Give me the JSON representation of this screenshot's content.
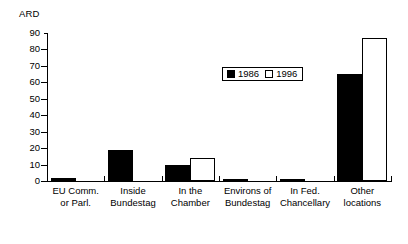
{
  "chart_data": {
    "type": "bar",
    "title": "",
    "xlabel": "",
    "ylabel": "ARD",
    "ylim": [
      0,
      90
    ],
    "ytick_step": 10,
    "yticks": [
      "0",
      "10",
      "20",
      "30",
      "40",
      "50",
      "60",
      "70",
      "80",
      "90"
    ],
    "grid": false,
    "legend_position": "inside-top-right",
    "categories": [
      "EU Comm. or Parl.",
      "Inside Bundestag",
      "In the Chamber",
      "Environs of Bundestag",
      "In Fed. Chancellary",
      "Other locations"
    ],
    "category_lines": [
      [
        "EU Comm.",
        "or Parl."
      ],
      [
        "Inside",
        "Bundestag"
      ],
      [
        "In the",
        "Chamber"
      ],
      [
        "Environs of",
        "Bundestag"
      ],
      [
        "In Fed.",
        "Chancellary"
      ],
      [
        "Other",
        "locations"
      ]
    ],
    "series": [
      {
        "name": "1986",
        "color": "#000000",
        "values": [
          2,
          19,
          10,
          1.5,
          1.5,
          65
        ]
      },
      {
        "name": "1996",
        "color": "#ffffff",
        "values": [
          0,
          0,
          14,
          0,
          0,
          87
        ]
      }
    ]
  },
  "legend": {
    "entries": [
      {
        "label": "1986",
        "style": "filled"
      },
      {
        "label": "1996",
        "style": "open"
      }
    ]
  }
}
